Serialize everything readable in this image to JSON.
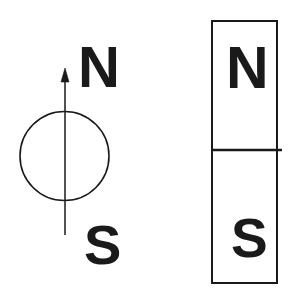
{
  "figure": {
    "background_color": "#ffffff",
    "ink_color": "#1a1a1a",
    "width": 299,
    "height": 295
  },
  "compass": {
    "name": "compass-needle-diagram",
    "circle": {
      "center_x": 64.5,
      "center_y": 156,
      "radius": 44.5,
      "stroke_width": 1.6,
      "fill": "none"
    },
    "needle": {
      "x": 65,
      "tip_y": 68,
      "tail_y": 235,
      "stroke_width": 1.4,
      "arrowhead_width": 8,
      "arrowhead_height": 14,
      "direction": "up"
    },
    "north_label": "N",
    "south_label": "S"
  },
  "bar_magnet": {
    "name": "bar-magnet-diagram",
    "rect": {
      "x": 212,
      "y": 21,
      "width": 65,
      "height": 262,
      "stroke_width": 2,
      "fill": "none"
    },
    "divider": {
      "y": 150,
      "x_start": 212,
      "x_end": 282,
      "stroke_width": 2.4
    },
    "north_label": "N",
    "south_label": "S"
  }
}
